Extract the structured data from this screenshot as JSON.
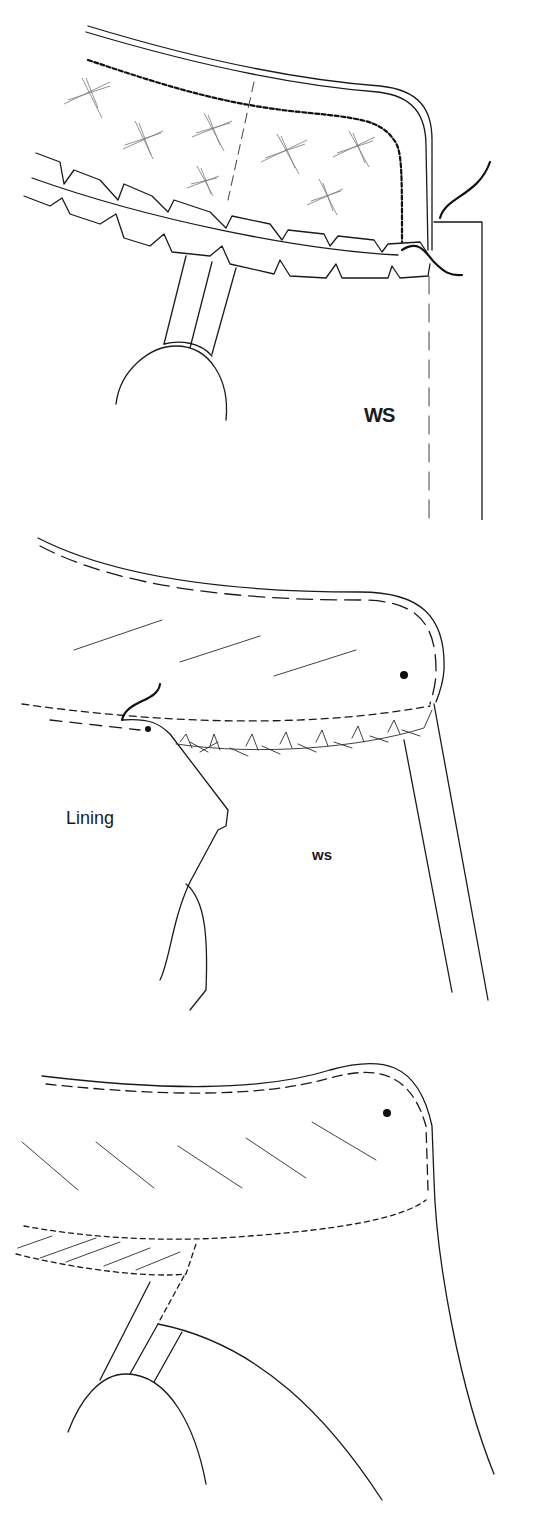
{
  "figure": {
    "panels": [
      {
        "id": "step-1",
        "labels": {
          "ws": "WS"
        }
      },
      {
        "id": "step-2",
        "labels": {
          "lining": "Lining",
          "ws": "WS"
        }
      },
      {
        "id": "step-3",
        "labels": {}
      }
    ],
    "colors": {
      "ink": "#1a1a1a",
      "background": "#ffffff"
    }
  }
}
